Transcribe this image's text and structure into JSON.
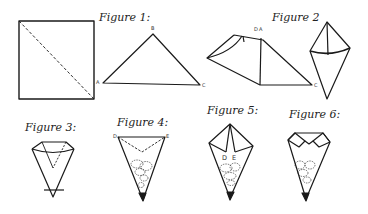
{
  "diagram": {
    "figures": [
      {
        "id": "figure-1",
        "title": "Figure 1:",
        "points": [
          "A",
          "B",
          "C"
        ]
      },
      {
        "id": "figure-2",
        "title": "Figure 2",
        "points": [
          "D",
          "A",
          "C"
        ]
      },
      {
        "id": "figure-3",
        "title": "Figure 3:"
      },
      {
        "id": "figure-4",
        "title": "Figure 4:",
        "points": [
          "D",
          "E"
        ]
      },
      {
        "id": "figure-5",
        "title": "Figure 5:",
        "points": [
          "D",
          "E"
        ]
      },
      {
        "id": "figure-6",
        "title": "Figure 6:"
      }
    ],
    "colors": {
      "line": "#1a1a1a",
      "background": "#ffffff"
    }
  }
}
